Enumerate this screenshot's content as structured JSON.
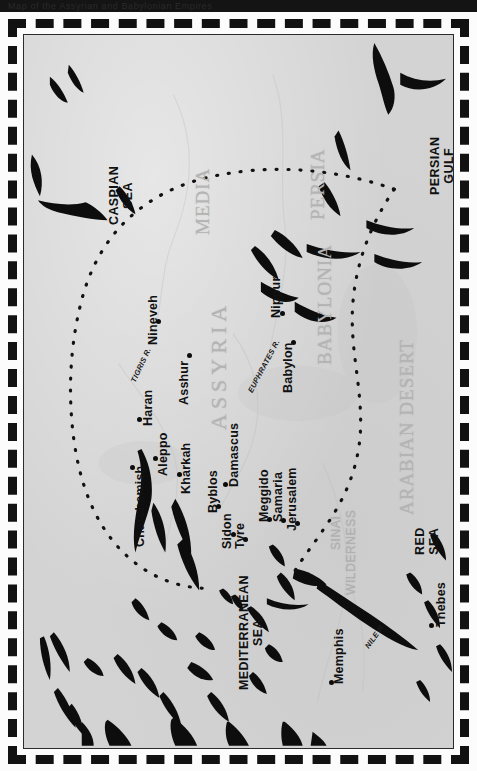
{
  "topbar": {
    "text": "Map of the Assyrian and Babylonian Empires"
  },
  "map": {
    "title": "Ancient Near East - Assyrian & Babylonian Empires",
    "background_color": "#d3d3d3",
    "ink_color": "#111111",
    "region_label_color": "#b4b4b4",
    "frame_style": "dashed",
    "orientation": "rotated-90-ccw",
    "regions": [
      {
        "name": "MEDIA",
        "x": 168,
        "y": 200,
        "size": "normal"
      },
      {
        "name": "PERSIA",
        "x": 283,
        "y": 185,
        "size": "normal"
      },
      {
        "name": "BABYLONIA",
        "x": 290,
        "y": 330,
        "size": "normal"
      },
      {
        "name": "ASSYRIA",
        "x": 182,
        "y": 395,
        "size": "big"
      },
      {
        "name": "ARABIAN DESERT",
        "x": 372,
        "y": 480,
        "size": "normal"
      },
      {
        "name": "SINAI",
        "x": 305,
        "y": 515,
        "size": "sinai"
      },
      {
        "name": "WILDERNESS",
        "x": 320,
        "y": 560,
        "size": "sinai"
      }
    ],
    "seas": [
      {
        "name": "CASPIAN SEA",
        "lines": [
          "CASPIAN",
          "SEA"
        ],
        "x": 83,
        "y": 190
      },
      {
        "name": "PERSIAN GULF",
        "lines": [
          "PERSIAN",
          "GULF"
        ],
        "x": 404,
        "y": 160
      },
      {
        "name": "RED SEA",
        "lines": [
          "RED",
          "SEA"
        ],
        "x": 389,
        "y": 520
      },
      {
        "name": "MEDITERRANEAN SEA",
        "lines": [
          "MEDITERRANEAN",
          "SEA"
        ],
        "x": 213,
        "y": 655
      }
    ],
    "rivers": [
      {
        "name": "TIGRIS R.",
        "x": 105,
        "y": 345,
        "rotate": -65
      },
      {
        "name": "EUPHRATES R.",
        "x": 222,
        "y": 355,
        "rotate": -62
      },
      {
        "name": "NILE R.",
        "x": 339,
        "y": 610,
        "rotate": -55
      }
    ],
    "cities": [
      {
        "name": "Nineveh",
        "label_x": 122,
        "label_y": 310,
        "dot_x": 132,
        "dot_y": 284
      },
      {
        "name": "Asshur",
        "label_x": 153,
        "label_y": 370,
        "dot_x": 163,
        "dot_y": 318
      },
      {
        "name": "Nippur",
        "label_x": 245,
        "label_y": 283,
        "dot_x": 256,
        "dot_y": 276
      },
      {
        "name": "Babylon",
        "label_x": 257,
        "label_y": 358,
        "dot_x": 267,
        "dot_y": 305
      },
      {
        "name": "Haran",
        "label_x": 117,
        "label_y": 391,
        "dot_x": 113,
        "dot_y": 382
      },
      {
        "name": "Aleppo",
        "label_x": 132,
        "label_y": 441,
        "dot_x": 129,
        "dot_y": 421
      },
      {
        "name": "Kharkah",
        "label_x": 155,
        "label_y": 459,
        "dot_x": 153,
        "dot_y": 437
      },
      {
        "name": "Charchemish",
        "label_x": 109,
        "label_y": 512,
        "dot_x": 106,
        "dot_y": 430
      },
      {
        "name": "Byblos",
        "label_x": 182,
        "label_y": 478,
        "dot_x": 192,
        "dot_y": 469
      },
      {
        "name": "Damascus",
        "label_x": 203,
        "label_y": 452,
        "dot_x": 199,
        "dot_y": 447
      },
      {
        "name": "Sidon",
        "label_x": 196,
        "label_y": 514,
        "dot_x": 207,
        "dot_y": 497
      },
      {
        "name": "Tyre",
        "label_x": 209,
        "label_y": 514,
        "dot_x": 219,
        "dot_y": 502
      },
      {
        "name": "Meggido",
        "label_x": 233,
        "label_y": 487,
        "dot_x": 243,
        "dot_y": 482
      },
      {
        "name": "Samaria",
        "label_x": 247,
        "label_y": 487,
        "dot_x": 257,
        "dot_y": 483
      },
      {
        "name": "Jerusalem",
        "label_x": 261,
        "label_y": 496,
        "dot_x": 271,
        "dot_y": 486
      },
      {
        "name": "Memphis",
        "label_x": 308,
        "label_y": 649,
        "dot_x": 305,
        "dot_y": 645
      },
      {
        "name": "Thebes",
        "label_x": 410,
        "label_y": 592,
        "dot_x": 405,
        "dot_y": 588
      }
    ]
  }
}
